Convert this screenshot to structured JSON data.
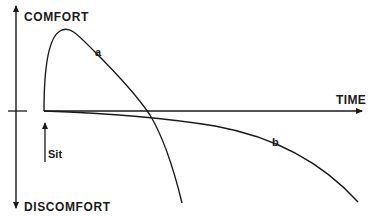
{
  "diagram": {
    "axis_labels": {
      "y_top": "COMFORT",
      "y_bottom": "DISCOMFORT",
      "x": "TIME"
    },
    "event_marker": {
      "label": "Sit"
    },
    "curves": [
      {
        "id": "a",
        "label": "a",
        "description": "Rapid rise to peak comfort shortly after sitting, then steep decline crossing into discomfort"
      },
      {
        "id": "b",
        "label": "b",
        "description": "Gradual, slowly accelerating decline into discomfort over time"
      }
    ],
    "colors": {
      "ink": "#1a1a1a",
      "background": "#ffffff"
    }
  }
}
